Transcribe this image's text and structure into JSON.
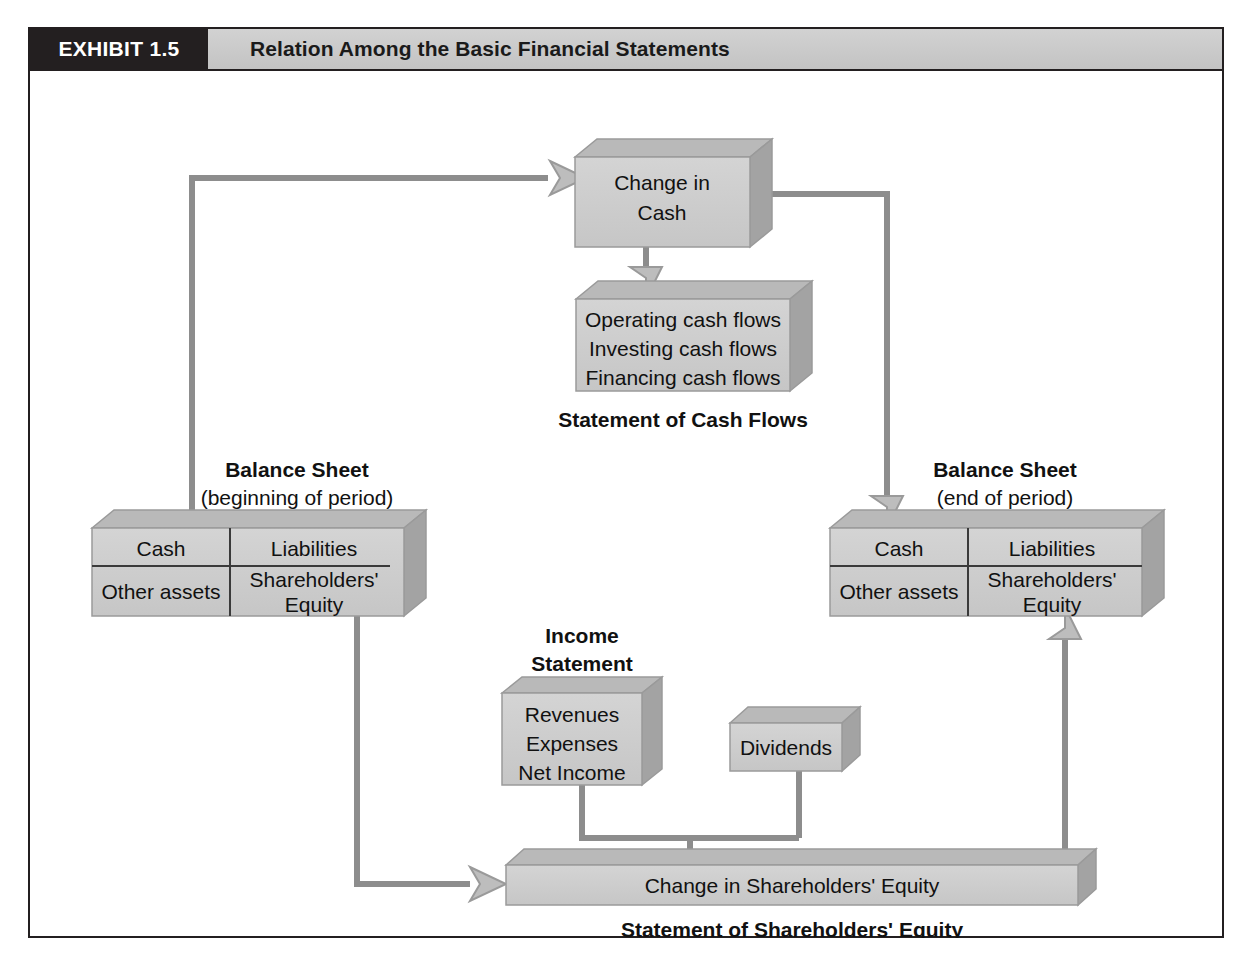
{
  "running_head": {
    "left": "",
    "right": ""
  },
  "exhibit": {
    "tag": "EXHIBIT 1.5",
    "title": "Relation Among the Basic Financial Statements"
  },
  "colors": {
    "box_fill": "#cdcdcd",
    "box_top_bevel": "#b3b3b3",
    "box_side_bevel": "#9a9a9a",
    "box_stroke": "#8d8d8d",
    "connector": "#8d8d8d",
    "header_bg": "#cbcbcb",
    "tag_bg": "#231f20",
    "frame": "#231f20",
    "text": "#111111",
    "page_bg": "#ffffff"
  },
  "nodes": {
    "change_in_cash": {
      "lines": [
        "Change in",
        "Cash"
      ]
    },
    "cash_flows": {
      "lines": [
        "Operating cash flows",
        "Investing cash flows",
        "Financing cash flows"
      ],
      "caption": "Statement of Cash Flows"
    },
    "balance_sheet_begin": {
      "caption": "Balance Sheet",
      "subcaption": "(beginning of period)",
      "cells": {
        "top_left": "Cash",
        "top_right": "Liabilities",
        "bottom_left": "Other assets",
        "bottom_right_line1": "Shareholders'",
        "bottom_right_line2": "Equity"
      }
    },
    "balance_sheet_end": {
      "caption": "Balance Sheet",
      "subcaption": "(end of period)",
      "cells": {
        "top_left": "Cash",
        "top_right": "Liabilities",
        "bottom_left": "Other assets",
        "bottom_right_line1": "Shareholders'",
        "bottom_right_line2": "Equity"
      }
    },
    "income_statement": {
      "caption_line1": "Income",
      "caption_line2": "Statement",
      "lines": [
        "Revenues",
        "Expenses",
        "Net Income"
      ]
    },
    "dividends": {
      "label": "Dividends"
    },
    "change_in_equity": {
      "label": "Change in Shareholders' Equity",
      "caption": "Statement of Shareholders' Equity"
    }
  },
  "connectors": [
    {
      "name": "begin-cash-to-change-in-cash",
      "from": "balance_sheet_begin.cash",
      "to": "change_in_cash"
    },
    {
      "name": "change-in-cash-to-cash-flows",
      "from": "change_in_cash",
      "to": "cash_flows"
    },
    {
      "name": "change-in-cash-to-end-cash",
      "from": "change_in_cash",
      "to": "balance_sheet_end.cash"
    },
    {
      "name": "begin-equity-to-change-in-equity",
      "from": "balance_sheet_begin.equity",
      "to": "change_in_equity"
    },
    {
      "name": "income-statement-to-change-in-equity",
      "from": "income_statement",
      "to": "change_in_equity"
    },
    {
      "name": "dividends-to-change-in-equity",
      "from": "dividends",
      "to": "change_in_equity"
    },
    {
      "name": "change-in-equity-to-end-equity",
      "from": "change_in_equity",
      "to": "balance_sheet_end.equity"
    }
  ]
}
